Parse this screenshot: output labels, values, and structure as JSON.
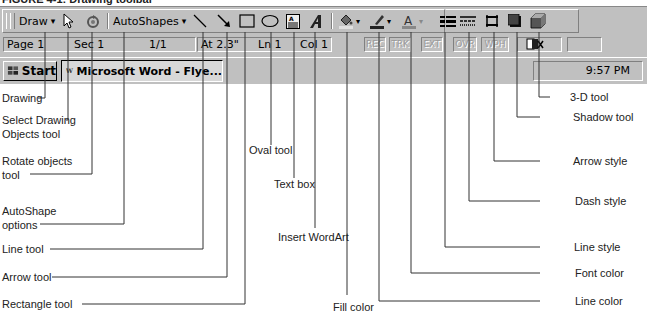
{
  "caption": "FIGURE 4-1: Drawing toolbar",
  "toolbar": {
    "draw_label": "Draw",
    "draw_dropdown": "▾",
    "autoshapes_label": "AutoShapes",
    "autoshapes_dropdown": "▾",
    "fill_dropdown": "▾",
    "line_color_dropdown": "▾",
    "font_color_dropdown": "▾"
  },
  "statusbar": {
    "page": "Page 1",
    "sec": "Sec 1",
    "pages": "1/1",
    "at": "At 2.3\"",
    "ln": "Ln 1",
    "col": "Col 1",
    "rec": "REC",
    "trk": "TRK",
    "ext": "EXT",
    "ovr": "OVR",
    "wph": "WPH"
  },
  "taskbar": {
    "start_label": "Start",
    "task_label": "Microsoft Word - Flye...",
    "clock": "9:57 PM"
  },
  "annotations": [
    {
      "id": "drawing",
      "text": "Drawing"
    },
    {
      "id": "select",
      "text": "Select Drawing\nObjects tool"
    },
    {
      "id": "rotate",
      "text": "Rotate objects\ntool"
    },
    {
      "id": "autoshape",
      "text": "AutoShape\noptions"
    },
    {
      "id": "line",
      "text": "Line tool"
    },
    {
      "id": "arrow",
      "text": "Arrow tool"
    },
    {
      "id": "rectangle",
      "text": "Rectangle tool"
    },
    {
      "id": "oval",
      "text": "Oval tool"
    },
    {
      "id": "textbox",
      "text": "Text box"
    },
    {
      "id": "wordart",
      "text": "Insert WordArt"
    },
    {
      "id": "fill",
      "text": "Fill color"
    },
    {
      "id": "linecolor",
      "text": "Line color"
    },
    {
      "id": "fontcolor",
      "text": "Font color"
    },
    {
      "id": "linestyle",
      "text": "Line style"
    },
    {
      "id": "dashstyle",
      "text": "Dash style"
    },
    {
      "id": "arrowstyle",
      "text": "Arrow style"
    },
    {
      "id": "shadow",
      "text": "Shadow tool"
    },
    {
      "id": "threed",
      "text": "3-D tool"
    }
  ]
}
